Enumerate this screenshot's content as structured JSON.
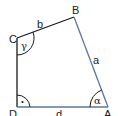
{
  "diagram": {
    "vertices": {
      "A": {
        "label": "A",
        "x": 108,
        "y": 107
      },
      "B": {
        "label": "B",
        "x": 74,
        "y": 17
      },
      "C": {
        "label": "C",
        "x": 17,
        "y": 38
      },
      "D": {
        "label": "D",
        "x": 17,
        "y": 107
      }
    },
    "sides": {
      "a": {
        "label": "a",
        "from": "A",
        "to": "B"
      },
      "b": {
        "label": "b",
        "from": "B",
        "to": "C"
      },
      "d": {
        "label": "d",
        "from": "D",
        "to": "A"
      }
    },
    "angles": {
      "alpha": {
        "label": "α",
        "vertex": "A"
      },
      "gamma": {
        "label": "γ",
        "vertex": "C"
      },
      "right": {
        "label": "·",
        "vertex": "D"
      }
    },
    "colors": {
      "dark_edge": "#1a1a1a",
      "blue_edge": "#5b7899"
    }
  }
}
